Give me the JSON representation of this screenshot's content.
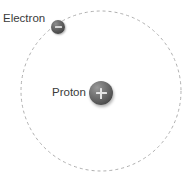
{
  "diagram": {
    "background_color": "#ffffff",
    "orbit": {
      "name": "electron-orbit",
      "shape": "circle",
      "center_x": 101,
      "center_y": 91,
      "radius": 80,
      "stroke_color": "#b0b0b0",
      "stroke_width": 1,
      "dash_pattern": "3 3",
      "style": "dashed"
    },
    "particles": [
      {
        "id": "proton",
        "label": "Proton",
        "charge_symbol": "+",
        "charge_icon": "plus-icon",
        "center_x": 101,
        "center_y": 93,
        "radius": 12,
        "fill_light": "#9a9a9a",
        "fill_dark": "#3e3e3e",
        "glyph_color": "#e4e4e4"
      },
      {
        "id": "electron",
        "label": "Electron",
        "charge_symbol": "−",
        "charge_icon": "minus-icon",
        "center_x": 58,
        "center_y": 27,
        "radius": 7,
        "fill_light": "#8e8e8e",
        "fill_dark": "#333333",
        "glyph_color": "#d6d6d6"
      }
    ],
    "labels": {
      "electron": "Electron",
      "proton": "Proton",
      "text_color": "#3a3a3a"
    }
  }
}
